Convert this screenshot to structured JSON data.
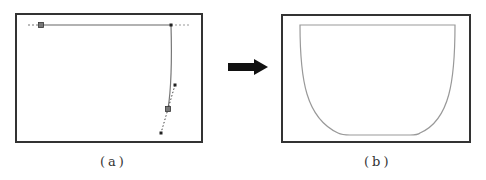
{
  "panels": [
    {
      "id": "a",
      "caption": "(a)",
      "description": "Bezier profile editing with control handles",
      "frame": {
        "x": 16,
        "y": 14,
        "width": 186,
        "height": 128
      },
      "top_line": {
        "x1": 41,
        "x2": 171,
        "y": 25
      },
      "dashed_left": {
        "x1": 28,
        "x2": 41,
        "y": 25
      },
      "dashed_right": {
        "x1": 171,
        "x2": 189,
        "y": 25
      },
      "profile_curve": "M171,25 C172,60 171,90 168,109",
      "handle_line": {
        "x1": 175,
        "y1": 85,
        "x2": 161,
        "y2": 133
      },
      "anchor_squares": [
        {
          "x": 41,
          "y": 25
        },
        {
          "x": 168,
          "y": 109
        }
      ],
      "handle_dots": [
        {
          "x": 171,
          "y": 25
        },
        {
          "x": 175,
          "y": 85
        },
        {
          "x": 161,
          "y": 133
        }
      ]
    },
    {
      "id": "b",
      "caption": "(b)",
      "description": "Resulting bowl cross-section outline",
      "frame": {
        "x": 282,
        "y": 15,
        "width": 188,
        "height": 127
      },
      "bowl_path": "M300,25 L455,25 C455,80 450,120 420,133 Q418,135 410,135 L350,135 Q342,135 338,133 C306,118 300,80 300,25 Z"
    }
  ],
  "arrow": {
    "direction": "right",
    "color": "#111111",
    "x1": 228,
    "x2": 268,
    "y": 67
  },
  "colors": {
    "frame": "#333333",
    "curve": "#888888",
    "handle": "#222222",
    "bowl": "#999999"
  }
}
